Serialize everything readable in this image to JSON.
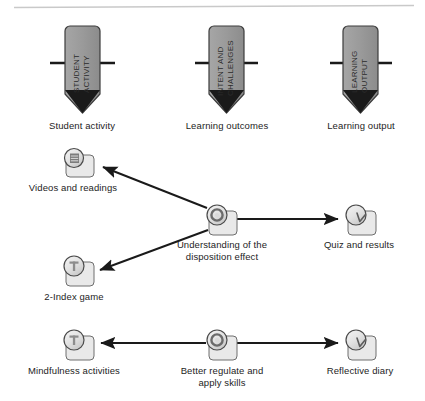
{
  "diagram": {
    "top_rule": {
      "color": "#c9c9c9"
    },
    "colors": {
      "pentagon_fill": "#9a9a9a",
      "pentagon_stroke": "#3c3c3c",
      "crossbar": "#1a1a1a",
      "arrow": "#1a1a1a",
      "icon_fill": "#e3e3e3",
      "icon_stroke": "#4a4a4a",
      "text": "#1d1d1d"
    },
    "swimlane_markers": [
      {
        "id": "student-activity",
        "vertical_label": "STUDENT ACTIVITY",
        "vertical_line_1": "STUDENT",
        "vertical_line_2": "ACTIVITY",
        "caption": "Student activity"
      },
      {
        "id": "learning-outcomes",
        "vertical_label": "INTENT AND CHALLENGES",
        "vertical_line_1": "INTENT AND",
        "vertical_line_2": "CHALLENGES",
        "caption": "Learning outcomes"
      },
      {
        "id": "learning-output",
        "vertical_label": "LEARNING OUTPUT",
        "vertical_line_1": "LEARNING",
        "vertical_line_2": "OUTPUT",
        "caption": "Learning output"
      }
    ],
    "nodes": [
      {
        "id": "videos-and-readings",
        "caption": "Videos and readings",
        "icon": "document-circle-icon"
      },
      {
        "id": "understanding-disposition-effect",
        "caption": "Understanding of the\ndisposition effect",
        "icon": "target-circle-icon"
      },
      {
        "id": "quiz-and-results",
        "caption": "Quiz and results",
        "icon": "check-circle-icon"
      },
      {
        "id": "two-index-game",
        "caption": "2-Index game",
        "icon": "text-circle-icon"
      },
      {
        "id": "mindfulness-activities",
        "caption": "Mindfulness activities",
        "icon": "text-circle-icon"
      },
      {
        "id": "better-regulate-apply-skills",
        "caption": "Better regulate and\napply skills",
        "icon": "target-circle-icon"
      },
      {
        "id": "reflective-diary",
        "caption": "Reflective diary",
        "icon": "check-circle-icon"
      }
    ],
    "arrows": [
      {
        "id": "arrow-to-videos",
        "from": "understanding-disposition-effect",
        "to": "videos-and-readings"
      },
      {
        "id": "arrow-to-quiz",
        "from": "understanding-disposition-effect",
        "to": "quiz-and-results"
      },
      {
        "id": "arrow-to-two-index-game",
        "from": "understanding-disposition-effect",
        "to": "two-index-game"
      },
      {
        "id": "arrow-to-mindfulness",
        "from": "better-regulate-apply-skills",
        "to": "mindfulness-activities"
      },
      {
        "id": "arrow-to-reflective-diary",
        "from": "better-regulate-apply-skills",
        "to": "reflective-diary"
      }
    ]
  }
}
